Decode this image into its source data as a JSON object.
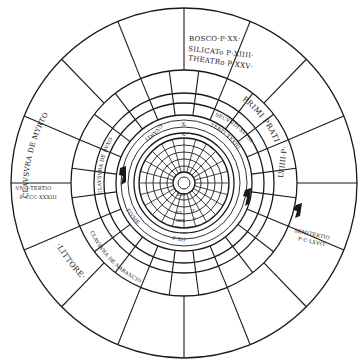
{
  "diagram": {
    "center": {
      "x": 184,
      "y": 183
    },
    "colors": {
      "ink": "#1a1a1a",
      "paper": "#ffffff"
    },
    "rings": [
      175,
      113,
      90,
      80,
      68,
      63,
      55,
      49,
      44,
      38,
      32,
      26,
      20,
      11,
      6
    ],
    "labels": {
      "bosco": "BOSCO·P·XX·",
      "silicato": "SILICATo P·XIIII·",
      "theatro": "THEATRo P·XXV·",
      "primi_prati": "PRIMI PRATI",
      "lviiii": "LVIIII·P·",
      "secundi": "SECVNDI·XLVIII",
      "terti": "TERTI·XXXIII",
      "clausura_de_myrto": "CLAVSVRA DE MYRTO",
      "clausura_de_buxo": "CLAVSVRA DE BVXO",
      "uno_tertio": "·VNO·TERTIO",
      "p_cccxxxiii": "·P·CCC·XXXIII",
      "littore": "·LITTORE·",
      "semitertio": "SEMITERTIO",
      "p_clxvit": "·P·C·LXVIT·",
      "clausura_de_narancio": "CLAVSVRA DE·NARANCIO",
      "p_xii": "·P·XII·",
      "fiume": "FIVME",
      "quarti": "QVARTI",
      "x_upper": "·X·",
      "x_lower": "·X·",
      "inner_xxv": "XXV",
      "inner_ii": "II",
      "inner_xx": "XX",
      "inner_xxx": "XXX",
      "inner_i": "I"
    }
  }
}
